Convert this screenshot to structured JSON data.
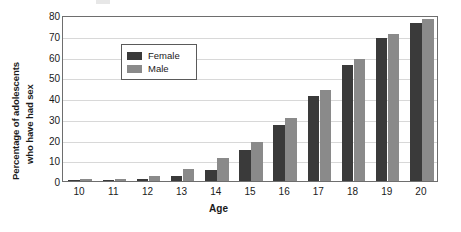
{
  "chart_data": {
    "type": "bar",
    "title": "",
    "xlabel": "Age",
    "ylabel_line1": "Percentage of adolescents",
    "ylabel_line2": "who have had sex",
    "categories": [
      "10",
      "11",
      "12",
      "13",
      "14",
      "15",
      "16",
      "17",
      "18",
      "19",
      "20"
    ],
    "series": [
      {
        "name": "Female",
        "color": "#3a3a3a",
        "values": [
          0.5,
          0.7,
          1.2,
          2.5,
          5.5,
          15,
          27,
          41,
          56,
          69,
          76
        ]
      },
      {
        "name": "Male",
        "color": "#8a8a8a",
        "values": [
          0.8,
          1.0,
          2.2,
          5.8,
          11,
          19,
          30.5,
          44,
          59,
          71,
          78
        ]
      }
    ],
    "ylim": [
      0,
      80
    ],
    "yticks": [
      "0",
      "10",
      "20",
      "30",
      "40",
      "50",
      "60",
      "70",
      "80"
    ],
    "grid": true,
    "legend_position": "upper-left-inside"
  },
  "legend": {
    "entries": [
      {
        "label": "Female"
      },
      {
        "label": "Male"
      }
    ]
  },
  "colors": {
    "female": "#3a3a3a",
    "male": "#8a8a8a",
    "grid": "#d8d8d8",
    "frame": "#6e6e6e",
    "text": "#1a1a1a"
  }
}
